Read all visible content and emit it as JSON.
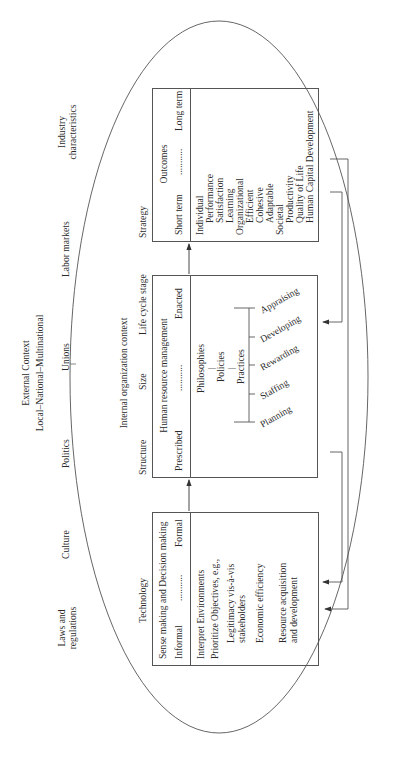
{
  "external_context": {
    "title": "External Context",
    "subtitle": "Local–National–Multinational",
    "factors": [
      "Laws and regulations",
      "Culture",
      "Politics",
      "Unions",
      "Labor markets",
      "Industry characteristics"
    ],
    "laws_line1": "Laws and",
    "laws_line2": "regulations",
    "industry_line1": "Industry",
    "industry_line2": "characteristics"
  },
  "internal_context": {
    "title": "Internal organization context",
    "factors": [
      "Technology",
      "Structure",
      "Size",
      "Life cycle stage",
      "Strategy"
    ]
  },
  "sense_making": {
    "title": "Sense making and Decision making",
    "left": "Informal",
    "dots": "...........",
    "right": "Formal",
    "items": [
      "Interpret Environments",
      "Prioritize Objectives, e.g.,",
      "Legitimacy vis-à-vis",
      "stakeholders",
      "Economic efficiency",
      "Resource acquisition",
      "and development"
    ]
  },
  "hrm": {
    "title": "Human resource management",
    "left": "Prescribed",
    "dots": "...........",
    "right": "Enacted",
    "hierarchy": [
      "Philosophies",
      "Policies",
      "Practices"
    ],
    "practices": [
      "Planning",
      "Staffing",
      "Rewarding",
      "Developing",
      "Appraising"
    ]
  },
  "outcomes": {
    "title": "Outcomes",
    "left": "Short term",
    "dots": "...........",
    "right": "Long term",
    "groups": [
      {
        "label": "Individual",
        "items": [
          "Performance",
          "Satisfaction",
          "Learning"
        ]
      },
      {
        "label": "Organizational",
        "items": [
          "Efficient",
          "Cohesive",
          "Adaptable"
        ]
      },
      {
        "label": "Societal",
        "items": [
          "Productivity",
          "Quality of Life",
          "Human Capital Development"
        ]
      }
    ]
  },
  "colors": {
    "line": "#555555",
    "text": "#2a2a2a",
    "background": "#ffffff"
  }
}
